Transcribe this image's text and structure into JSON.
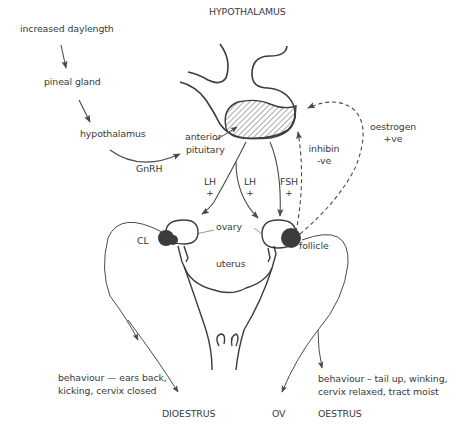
{
  "title": "HYPOTHALAMUS",
  "pathway": {
    "step1": "increased daylength",
    "step2": "pineal gland",
    "step3": "hypothalamus",
    "hormone_gnrh": "GnRH",
    "target": "anterior pituitary"
  },
  "pituitary_label": [
    "anterior",
    "pituitary"
  ],
  "hormones": {
    "lh_left": {
      "name": "LH",
      "effect": "+"
    },
    "lh_right": {
      "name": "LH",
      "effect": "+"
    },
    "fsh": {
      "name": "FSH",
      "effect": "+"
    },
    "inhibin": {
      "name": "inhibin",
      "effect": "-ve"
    },
    "oestrogen": {
      "name": "oestrogen",
      "effect": "+ve"
    }
  },
  "anatomy": {
    "ovary": "ovary",
    "cl": "CL",
    "follicle": "follicle",
    "uterus": "uterus"
  },
  "outcomes": {
    "dioestrus_behaviour": [
      "behaviour — ears back,",
      "kicking, cervix closed"
    ],
    "dioestrus": "DIOESTRUS",
    "ov": "OV",
    "oestrus_behaviour": [
      "behaviour – tail up, winking,",
      "cervix relaxed, tract moist"
    ],
    "oestrus": "OESTRUS"
  },
  "colors": {
    "line": "#4a4a4a",
    "text": "#3a3a3a",
    "fill_dark": "#3c3c3c",
    "background": "#ffffff"
  }
}
